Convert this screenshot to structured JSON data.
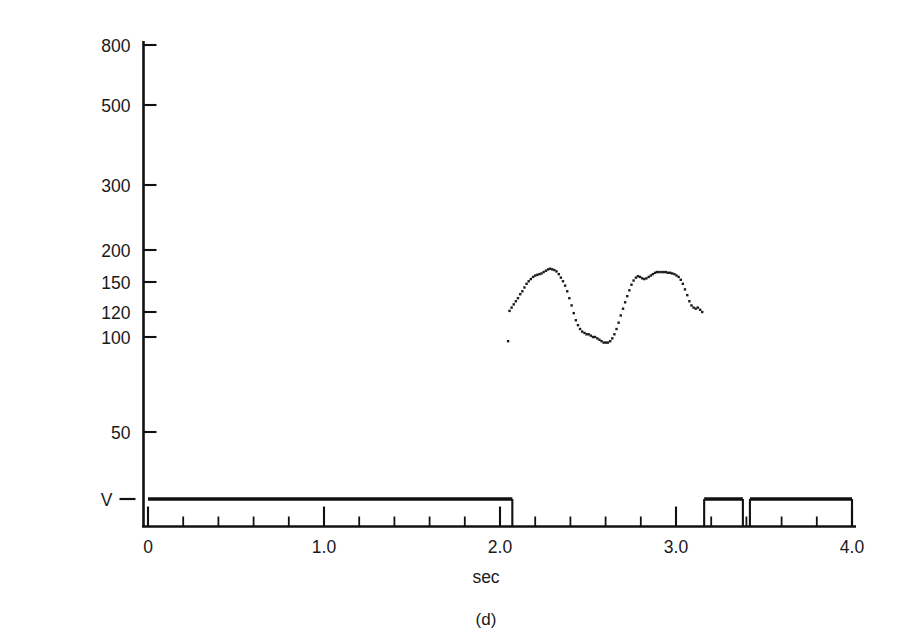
{
  "figure": {
    "panel_label": "(d)",
    "y_axis_title": "Fx (Hz)",
    "x_axis_title": "sec",
    "ink_color": "#111111",
    "background_color": "#ffffff"
  },
  "chart_data": {
    "type": "scatter",
    "title": "",
    "subtitle": "",
    "panel": "(d)",
    "xlabel": "sec",
    "ylabel": "Fx (Hz)",
    "grid": false,
    "legend": false,
    "y_scale": "logarithmic-irregular",
    "xlim": [
      0,
      4.0
    ],
    "ylim_labels": [
      "V",
      "50",
      "100",
      "120",
      "150",
      "200",
      "300",
      "500",
      "800"
    ],
    "y_ticks": [
      {
        "label": "800",
        "value": 800,
        "px": 45
      },
      {
        "label": "500",
        "value": 500,
        "px": 105
      },
      {
        "label": "300",
        "value": 300,
        "px": 185
      },
      {
        "label": "200",
        "value": 200,
        "px": 250
      },
      {
        "label": "150",
        "value": 150,
        "px": 282
      },
      {
        "label": "120",
        "value": 120,
        "px": 312
      },
      {
        "label": "100",
        "value": 100,
        "px": 337
      },
      {
        "label": "50",
        "value": 50,
        "px": 432
      },
      {
        "label": "V",
        "value": 0,
        "px": 499
      }
    ],
    "x_ticks_major": [
      {
        "label": "0",
        "value": 0.0
      },
      {
        "label": "1.0",
        "value": 1.0
      },
      {
        "label": "2.0",
        "value": 2.0
      },
      {
        "label": "3.0",
        "value": 3.0
      },
      {
        "label": "4.0",
        "value": 4.0
      }
    ],
    "x_minor_tick_interval": 0.2,
    "series": [
      {
        "name": "Fx contour",
        "style": "dotted-trace",
        "x_range": [
          2.05,
          3.16
        ],
        "y_range_hz": [
          96,
          169
        ],
        "points": [
          {
            "t": 2.046,
            "hz": 97
          },
          {
            "t": 2.054,
            "hz": 121
          },
          {
            "t": 2.066,
            "hz": 124
          },
          {
            "t": 2.078,
            "hz": 127
          },
          {
            "t": 2.09,
            "hz": 130
          },
          {
            "t": 2.102,
            "hz": 133
          },
          {
            "t": 2.115,
            "hz": 137
          },
          {
            "t": 2.127,
            "hz": 140
          },
          {
            "t": 2.139,
            "hz": 144
          },
          {
            "t": 2.151,
            "hz": 148
          },
          {
            "t": 2.163,
            "hz": 151
          },
          {
            "t": 2.175,
            "hz": 154
          },
          {
            "t": 2.188,
            "hz": 157
          },
          {
            "t": 2.2,
            "hz": 159
          },
          {
            "t": 2.212,
            "hz": 160
          },
          {
            "t": 2.224,
            "hz": 161
          },
          {
            "t": 2.236,
            "hz": 162
          },
          {
            "t": 2.248,
            "hz": 164
          },
          {
            "t": 2.261,
            "hz": 166
          },
          {
            "t": 2.273,
            "hz": 168
          },
          {
            "t": 2.285,
            "hz": 169
          },
          {
            "t": 2.297,
            "hz": 168
          },
          {
            "t": 2.309,
            "hz": 167
          },
          {
            "t": 2.321,
            "hz": 165
          },
          {
            "t": 2.334,
            "hz": 161
          },
          {
            "t": 2.346,
            "hz": 156
          },
          {
            "t": 2.358,
            "hz": 151
          },
          {
            "t": 2.37,
            "hz": 146
          },
          {
            "t": 2.382,
            "hz": 140
          },
          {
            "t": 2.394,
            "hz": 133
          },
          {
            "t": 2.407,
            "hz": 126
          },
          {
            "t": 2.419,
            "hz": 119
          },
          {
            "t": 2.431,
            "hz": 113
          },
          {
            "t": 2.443,
            "hz": 109
          },
          {
            "t": 2.455,
            "hz": 106
          },
          {
            "t": 2.467,
            "hz": 104
          },
          {
            "t": 2.48,
            "hz": 103
          },
          {
            "t": 2.492,
            "hz": 102
          },
          {
            "t": 2.504,
            "hz": 102
          },
          {
            "t": 2.516,
            "hz": 101
          },
          {
            "t": 2.528,
            "hz": 100
          },
          {
            "t": 2.54,
            "hz": 100
          },
          {
            "t": 2.553,
            "hz": 99
          },
          {
            "t": 2.565,
            "hz": 98
          },
          {
            "t": 2.577,
            "hz": 97
          },
          {
            "t": 2.589,
            "hz": 96
          },
          {
            "t": 2.601,
            "hz": 96
          },
          {
            "t": 2.613,
            "hz": 96
          },
          {
            "t": 2.626,
            "hz": 97
          },
          {
            "t": 2.638,
            "hz": 99
          },
          {
            "t": 2.65,
            "hz": 102
          },
          {
            "t": 2.662,
            "hz": 106
          },
          {
            "t": 2.674,
            "hz": 111
          },
          {
            "t": 2.686,
            "hz": 117
          },
          {
            "t": 2.699,
            "hz": 123
          },
          {
            "t": 2.711,
            "hz": 129
          },
          {
            "t": 2.723,
            "hz": 135
          },
          {
            "t": 2.735,
            "hz": 141
          },
          {
            "t": 2.747,
            "hz": 147
          },
          {
            "t": 2.759,
            "hz": 152
          },
          {
            "t": 2.772,
            "hz": 156
          },
          {
            "t": 2.784,
            "hz": 158
          },
          {
            "t": 2.796,
            "hz": 157
          },
          {
            "t": 2.808,
            "hz": 155
          },
          {
            "t": 2.82,
            "hz": 154
          },
          {
            "t": 2.832,
            "hz": 155
          },
          {
            "t": 2.845,
            "hz": 157
          },
          {
            "t": 2.857,
            "hz": 159
          },
          {
            "t": 2.869,
            "hz": 161
          },
          {
            "t": 2.881,
            "hz": 163
          },
          {
            "t": 2.893,
            "hz": 164
          },
          {
            "t": 2.905,
            "hz": 164
          },
          {
            "t": 2.918,
            "hz": 164
          },
          {
            "t": 2.93,
            "hz": 164
          },
          {
            "t": 2.942,
            "hz": 164
          },
          {
            "t": 2.954,
            "hz": 163
          },
          {
            "t": 2.966,
            "hz": 163
          },
          {
            "t": 2.978,
            "hz": 162
          },
          {
            "t": 2.991,
            "hz": 161
          },
          {
            "t": 3.003,
            "hz": 159
          },
          {
            "t": 3.015,
            "hz": 157
          },
          {
            "t": 3.027,
            "hz": 153
          },
          {
            "t": 3.039,
            "hz": 148
          },
          {
            "t": 3.051,
            "hz": 142
          },
          {
            "t": 3.064,
            "hz": 136
          },
          {
            "t": 3.076,
            "hz": 130
          },
          {
            "t": 3.088,
            "hz": 126
          },
          {
            "t": 3.1,
            "hz": 124
          },
          {
            "t": 3.112,
            "hz": 123
          },
          {
            "t": 3.124,
            "hz": 124
          },
          {
            "t": 3.137,
            "hz": 122
          },
          {
            "t": 3.149,
            "hz": 120
          }
        ]
      },
      {
        "name": "Voicing bar (V)",
        "style": "thick-horizontal-segments",
        "segments": [
          {
            "t_start": 0.0,
            "t_end": 2.07
          },
          {
            "t_start": 3.16,
            "t_end": 3.38
          },
          {
            "t_start": 3.42,
            "t_end": 4.0
          }
        ]
      }
    ],
    "annotations": [
      {
        "text": "V",
        "meaning": "voicing baseline marker",
        "position": "y-axis below 50"
      }
    ]
  }
}
